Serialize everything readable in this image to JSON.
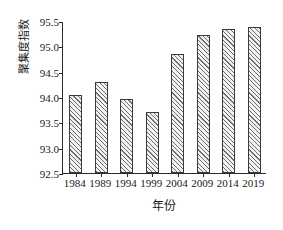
{
  "chart_data": {
    "type": "bar",
    "title": "",
    "subtitle": "",
    "xlabel": "年份",
    "ylabel": "聚集度指数",
    "categories": [
      "1984",
      "1989",
      "1994",
      "1999",
      "2004",
      "2009",
      "2014",
      "2019"
    ],
    "values": [
      94.04,
      94.3,
      93.96,
      93.71,
      94.85,
      95.22,
      95.34,
      95.38
    ],
    "series": [
      {
        "name": "聚集度指数",
        "values": [
          94.04,
          94.3,
          93.96,
          93.71,
          94.85,
          95.22,
          95.34,
          95.38
        ]
      }
    ],
    "ylim": [
      92.5,
      95.5
    ],
    "yticks": [
      92.5,
      93.0,
      93.5,
      94.0,
      94.5,
      95.0,
      95.5
    ],
    "ytick_labels": [
      "92.5",
      "93.0",
      "93.5",
      "94.0",
      "94.5",
      "95.0",
      "95.5"
    ],
    "xtick_labels": [
      "1984",
      "1989",
      "1994",
      "1999",
      "2004",
      "2009",
      "2014",
      "2019"
    ],
    "grid": false,
    "legend": false,
    "legend_position": "none",
    "bar_fill": "#f2f2f2",
    "bar_hatch": "diagonal-lines",
    "bar_edge_color": "#3a3a3a",
    "axis_color": "#2b2b2b",
    "background": "#ffffff",
    "annotations": []
  }
}
